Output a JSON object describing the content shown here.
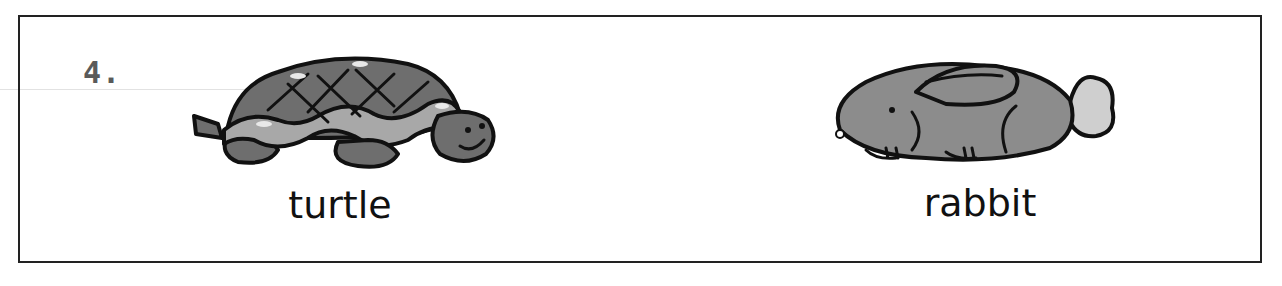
{
  "exercise": {
    "number": "4.",
    "items": [
      {
        "label": "turtle",
        "icon": "turtle-icon"
      },
      {
        "label": "rabbit",
        "icon": "rabbit-icon"
      }
    ]
  },
  "colors": {
    "border": "#222222",
    "number": "#5a5a5a",
    "shell": "#6e6e6e",
    "shell_band": "#a8a8a8",
    "rabbit_body": "#8c8c8c",
    "rabbit_tail": "#cfcfcf",
    "outline": "#111111"
  }
}
